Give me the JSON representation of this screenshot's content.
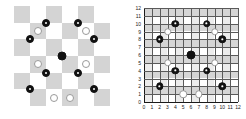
{
  "figure": {
    "title": "",
    "panels": [
      {
        "id": "left",
        "name": "checkerboard-panel",
        "label": ""
      },
      {
        "id": "right",
        "name": "coordinate-grid-panel",
        "label": ""
      }
    ]
  },
  "chart_data": {
    "type": "scatter",
    "title": "",
    "subtitle": "",
    "xlabel": "",
    "ylabel": "",
    "xlim": [
      0,
      12
    ],
    "ylim": [
      0,
      12
    ],
    "grid": true,
    "legend_position": "none",
    "xticks": [
      0,
      1,
      2,
      3,
      4,
      5,
      6,
      7,
      8,
      9,
      10,
      11,
      12
    ],
    "yticks": [
      0,
      1,
      2,
      3,
      4,
      5,
      6,
      7,
      8,
      9,
      10,
      11,
      12
    ],
    "xtick_labels": [
      "0",
      "1",
      "2",
      "3",
      "4",
      "5",
      "6",
      "7",
      "8",
      "9",
      "10",
      "11",
      "12"
    ],
    "ytick_labels": [
      "0",
      "1",
      "2",
      "3",
      "4",
      "5",
      "6",
      "7",
      "8",
      "9",
      "10",
      "11",
      "12"
    ],
    "series": [
      {
        "name": "center",
        "marker": "filled",
        "color": "#111111",
        "points": [
          {
            "x": 6,
            "y": 6
          }
        ]
      },
      {
        "name": "dotted",
        "marker": "dotted",
        "color": "#111111",
        "points": [
          {
            "x": 4,
            "y": 10
          },
          {
            "x": 8,
            "y": 10
          },
          {
            "x": 2,
            "y": 8
          },
          {
            "x": 10,
            "y": 8
          },
          {
            "x": 4,
            "y": 4
          },
          {
            "x": 8,
            "y": 4
          },
          {
            "x": 2,
            "y": 2
          },
          {
            "x": 10,
            "y": 2
          }
        ]
      },
      {
        "name": "open",
        "marker": "open",
        "color": "#9a9a9a",
        "points": [
          {
            "x": 3,
            "y": 9
          },
          {
            "x": 9,
            "y": 9
          },
          {
            "x": 3,
            "y": 5
          },
          {
            "x": 9,
            "y": 5
          },
          {
            "x": 5,
            "y": 1
          },
          {
            "x": 7,
            "y": 1
          }
        ]
      }
    ]
  },
  "checkerboard": {
    "name": "checkerboard",
    "columns": 6,
    "rows": 6,
    "shaded_color": "#d4d4d4",
    "light_color": "#ffffff"
  },
  "colors": {
    "marker_fill": "#111111",
    "marker_open_stroke": "#9a9a9a",
    "grid_line": "#5a5a5a",
    "axis_line": "#1a1a1a",
    "band": "#d4d4d4",
    "background": "#ffffff"
  }
}
